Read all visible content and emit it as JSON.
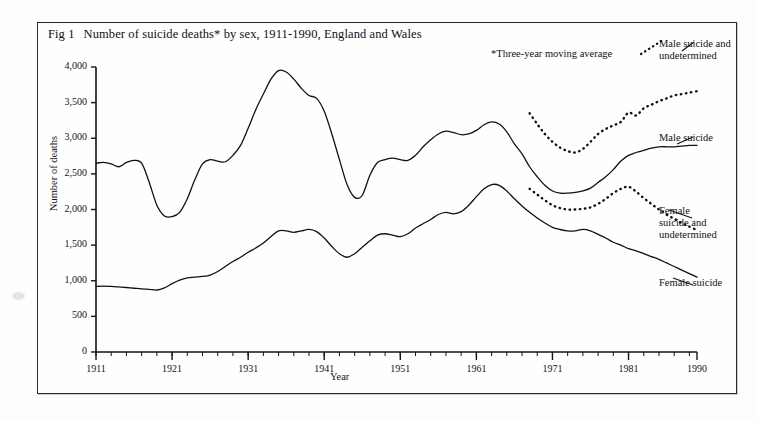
{
  "figure": {
    "number": "Fig 1",
    "title": "Number of suicide deaths* by sex, 1911-1990, England and Wales",
    "footnote": "*Three-year moving average"
  },
  "labels": {
    "male_suicide_undetermined_line1": "Male suicide and",
    "male_suicide_undetermined_line2": "undetermined",
    "male_suicide": "Male suicide",
    "female_suicide_undetermined_line1": "Female",
    "female_suicide_undetermined_line2": "suicide and",
    "female_suicide_undetermined_line3": "undetermined",
    "female_suicide": "Female suicide"
  },
  "chart_data": {
    "type": "line",
    "title": "Number of suicide deaths* by sex, 1911-1990, England and Wales",
    "xlabel": "Year",
    "ylabel": "Number of deaths",
    "xlim": [
      1911,
      1990
    ],
    "ylim": [
      0,
      4000
    ],
    "yticks": [
      0,
      500,
      1000,
      1500,
      2000,
      2500,
      3000,
      3500,
      4000
    ],
    "ytick_labels": [
      "0",
      "500",
      "1,000",
      "1,500",
      "2,000",
      "2,500",
      "3,000",
      "3,500",
      "4,000"
    ],
    "xticks": [
      1911,
      1921,
      1931,
      1941,
      1951,
      1961,
      1971,
      1981,
      1990
    ],
    "xtick_labels": [
      "1911",
      "1921",
      "1931",
      "1941",
      "1951",
      "1961",
      "1971",
      "1981",
      "1990"
    ],
    "x_minor_tick_interval": 2,
    "grid": false,
    "legend_position": "right-inline-labels",
    "annotations": [
      "*Three-year moving average"
    ],
    "series": [
      {
        "name": "Male suicide",
        "style": "solid",
        "color": "#111111",
        "x": [
          1911,
          1912,
          1913,
          1914,
          1915,
          1916,
          1917,
          1918,
          1919,
          1920,
          1921,
          1922,
          1923,
          1924,
          1925,
          1926,
          1927,
          1928,
          1929,
          1930,
          1931,
          1932,
          1933,
          1934,
          1935,
          1936,
          1937,
          1938,
          1939,
          1940,
          1941,
          1942,
          1943,
          1944,
          1945,
          1946,
          1947,
          1948,
          1949,
          1950,
          1951,
          1952,
          1953,
          1954,
          1955,
          1956,
          1957,
          1958,
          1959,
          1960,
          1961,
          1962,
          1963,
          1964,
          1965,
          1966,
          1967,
          1968,
          1969,
          1970,
          1971,
          1972,
          1973,
          1974,
          1975,
          1976,
          1977,
          1978,
          1979,
          1980,
          1981,
          1982,
          1983,
          1984,
          1985,
          1986,
          1987,
          1988,
          1989,
          1990
        ],
        "values": [
          2650,
          2660,
          2640,
          2600,
          2660,
          2690,
          2650,
          2380,
          2060,
          1910,
          1900,
          1960,
          2150,
          2420,
          2640,
          2700,
          2680,
          2670,
          2760,
          2900,
          3140,
          3400,
          3620,
          3830,
          3950,
          3930,
          3830,
          3700,
          3600,
          3560,
          3380,
          3060,
          2700,
          2350,
          2170,
          2200,
          2480,
          2660,
          2700,
          2720,
          2700,
          2690,
          2760,
          2880,
          2980,
          3060,
          3100,
          3080,
          3050,
          3060,
          3110,
          3190,
          3230,
          3200,
          3090,
          2920,
          2780,
          2600,
          2460,
          2340,
          2260,
          2230,
          2230,
          2240,
          2260,
          2300,
          2380,
          2460,
          2560,
          2680,
          2760,
          2800,
          2830,
          2860,
          2880,
          2880,
          2880,
          2890,
          2900,
          2900
        ]
      },
      {
        "name": "Male suicide and undetermined",
        "style": "dotted",
        "color": "#111111",
        "x": [
          1968,
          1969,
          1970,
          1971,
          1972,
          1973,
          1974,
          1975,
          1976,
          1977,
          1978,
          1979,
          1980,
          1981,
          1982,
          1983,
          1984,
          1985,
          1986,
          1987,
          1988,
          1989,
          1990
        ],
        "values": [
          3350,
          3200,
          3060,
          2950,
          2870,
          2820,
          2800,
          2850,
          2950,
          3060,
          3130,
          3180,
          3230,
          3360,
          3320,
          3420,
          3470,
          3520,
          3560,
          3600,
          3620,
          3640,
          3660
        ]
      },
      {
        "name": "Female suicide",
        "style": "solid",
        "color": "#111111",
        "x": [
          1911,
          1912,
          1913,
          1914,
          1915,
          1916,
          1917,
          1918,
          1919,
          1920,
          1921,
          1922,
          1923,
          1924,
          1925,
          1926,
          1927,
          1928,
          1929,
          1930,
          1931,
          1932,
          1933,
          1934,
          1935,
          1936,
          1937,
          1938,
          1939,
          1940,
          1941,
          1942,
          1943,
          1944,
          1945,
          1946,
          1947,
          1948,
          1949,
          1950,
          1951,
          1952,
          1953,
          1954,
          1955,
          1956,
          1957,
          1958,
          1959,
          1960,
          1961,
          1962,
          1963,
          1964,
          1965,
          1966,
          1967,
          1968,
          1969,
          1970,
          1971,
          1972,
          1973,
          1974,
          1975,
          1976,
          1977,
          1978,
          1979,
          1980,
          1981,
          1982,
          1983,
          1984,
          1985,
          1986,
          1987,
          1988,
          1989,
          1990
        ],
        "values": [
          920,
          925,
          920,
          915,
          905,
          895,
          885,
          880,
          870,
          900,
          960,
          1010,
          1040,
          1050,
          1060,
          1080,
          1130,
          1200,
          1270,
          1330,
          1400,
          1460,
          1530,
          1620,
          1700,
          1700,
          1680,
          1700,
          1720,
          1690,
          1600,
          1480,
          1380,
          1330,
          1380,
          1470,
          1560,
          1640,
          1660,
          1640,
          1620,
          1660,
          1740,
          1800,
          1860,
          1930,
          1960,
          1940,
          1970,
          2060,
          2180,
          2290,
          2350,
          2340,
          2260,
          2150,
          2050,
          1960,
          1880,
          1810,
          1750,
          1720,
          1700,
          1700,
          1720,
          1700,
          1650,
          1600,
          1540,
          1500,
          1450,
          1420,
          1380,
          1340,
          1300,
          1250,
          1200,
          1150,
          1100,
          1050
        ]
      },
      {
        "name": "Female suicide and undetermined",
        "style": "dotted",
        "color": "#111111",
        "x": [
          1968,
          1969,
          1970,
          1971,
          1972,
          1973,
          1974,
          1975,
          1976,
          1977,
          1978,
          1979,
          1980,
          1981,
          1982,
          1983,
          1984,
          1985,
          1986,
          1987,
          1988,
          1989,
          1990
        ],
        "values": [
          2290,
          2210,
          2130,
          2060,
          2020,
          2000,
          2000,
          2010,
          2030,
          2080,
          2150,
          2230,
          2290,
          2320,
          2250,
          2160,
          2080,
          2000,
          1930,
          1870,
          1810,
          1760,
          1710
        ]
      }
    ]
  }
}
